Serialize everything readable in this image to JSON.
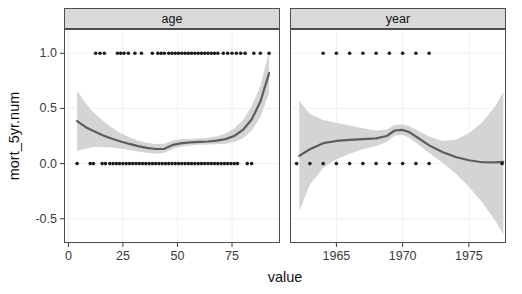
{
  "chart_data": {
    "type": "line",
    "title": "",
    "subtitle": "",
    "xlabel": "value",
    "ylabel": "mort_5yr.num",
    "grid": true,
    "legend": false,
    "facet_variable": "variable",
    "panels": [
      {
        "strip_label": "age",
        "xlim": [
          -2,
          97
        ],
        "ylim": [
          -0.72,
          1.22
        ],
        "xticks": [
          0,
          25,
          50,
          75
        ],
        "xtick_labels": [
          "0",
          "25",
          "50",
          "75"
        ],
        "yticks": [
          -0.5,
          0.0,
          0.5,
          1.0
        ],
        "ytick_labels": [
          "-0.5",
          "0.0",
          "0.5",
          "1.0"
        ],
        "fit": {
          "name": "loess fit",
          "x": [
            4,
            8,
            12,
            16,
            20,
            24,
            28,
            32,
            36,
            40,
            44,
            48,
            52,
            56,
            60,
            64,
            68,
            72,
            76,
            80,
            84,
            88,
            92
          ],
          "y": [
            0.385,
            0.33,
            0.29,
            0.255,
            0.225,
            0.2,
            0.178,
            0.158,
            0.142,
            0.132,
            0.134,
            0.17,
            0.186,
            0.192,
            0.196,
            0.2,
            0.208,
            0.222,
            0.25,
            0.305,
            0.4,
            0.56,
            0.82
          ]
        },
        "confidence_band": {
          "name": "95% confidence interval",
          "x": [
            4,
            8,
            12,
            16,
            20,
            24,
            28,
            32,
            36,
            40,
            44,
            48,
            52,
            56,
            60,
            64,
            68,
            72,
            76,
            80,
            84,
            88,
            92
          ],
          "lower": [
            0.115,
            0.135,
            0.15,
            0.15,
            0.145,
            0.135,
            0.122,
            0.11,
            0.098,
            0.09,
            0.095,
            0.135,
            0.155,
            0.165,
            0.17,
            0.172,
            0.175,
            0.18,
            0.195,
            0.23,
            0.3,
            0.42,
            0.64
          ],
          "upper": [
            0.66,
            0.545,
            0.455,
            0.385,
            0.325,
            0.275,
            0.238,
            0.208,
            0.188,
            0.178,
            0.18,
            0.21,
            0.222,
            0.225,
            0.228,
            0.234,
            0.248,
            0.272,
            0.318,
            0.395,
            0.52,
            0.7,
            1.02
          ]
        },
        "points_top": {
          "name": "observations mort_5yr.num = 1",
          "y": 1.0,
          "x": [
            12.5,
            14.5,
            16.5,
            22.5,
            24.0,
            25.5,
            27.5,
            30.5,
            33.5,
            38.5,
            41.0,
            42.5,
            44.0,
            46.0,
            47.5,
            49.0,
            50.5,
            52.0,
            53.5,
            55.0,
            56.5,
            58.0,
            59.5,
            61.0,
            62.5,
            64.0,
            65.5,
            67.0,
            68.5,
            71.0,
            73.0,
            75.0,
            77.0,
            79.0,
            81.0,
            85.0,
            88.0,
            92.0
          ]
        },
        "points_bottom": {
          "name": "observations mort_5yr.num = 0",
          "y": 0.0,
          "x": [
            4.0,
            10.0,
            11.5,
            15.5,
            17.0,
            19.0,
            20.5,
            22.0,
            23.5,
            25.0,
            26.5,
            28.0,
            29.5,
            31.0,
            32.5,
            34.0,
            35.5,
            37.0,
            38.5,
            40.0,
            41.5,
            43.0,
            44.5,
            46.0,
            47.5,
            49.0,
            50.5,
            52.0,
            53.5,
            55.0,
            56.5,
            58.0,
            59.5,
            61.0,
            62.5,
            64.0,
            65.5,
            67.0,
            68.5,
            70.0,
            71.5,
            73.0,
            74.5,
            76.0,
            77.5,
            82.0,
            84.0
          ]
        }
      },
      {
        "strip_label": "year",
        "xlim": [
          1961.5,
          1977.8
        ],
        "ylim": [
          -0.72,
          1.22
        ],
        "xticks": [
          1965,
          1970,
          1975
        ],
        "xtick_labels": [
          "1965",
          "1970",
          "1975"
        ],
        "yticks": [
          -0.5,
          0.0,
          0.5,
          1.0
        ],
        "ytick_labels": [
          "-0.5",
          "0.0",
          "0.5",
          "1.0"
        ],
        "fit": {
          "name": "loess fit",
          "x": [
            1962.2,
            1963.0,
            1964.0,
            1965.0,
            1966.0,
            1967.0,
            1968.0,
            1968.8,
            1969.4,
            1970.0,
            1970.5,
            1971.2,
            1972.0,
            1973.0,
            1974.0,
            1975.0,
            1976.0,
            1977.0,
            1977.6
          ],
          "y": [
            0.07,
            0.13,
            0.185,
            0.205,
            0.215,
            0.222,
            0.228,
            0.25,
            0.3,
            0.305,
            0.285,
            0.23,
            0.165,
            0.105,
            0.06,
            0.03,
            0.012,
            0.01,
            0.015
          ]
        },
        "confidence_band": {
          "name": "95% confidence interval",
          "x": [
            1962.2,
            1963.0,
            1964.0,
            1965.0,
            1966.0,
            1967.0,
            1968.0,
            1968.8,
            1969.4,
            1970.0,
            1970.5,
            1971.2,
            1972.0,
            1973.0,
            1974.0,
            1975.0,
            1976.0,
            1977.0,
            1977.6
          ],
          "lower": [
            -0.43,
            -0.19,
            -0.04,
            0.04,
            0.09,
            0.13,
            0.16,
            0.195,
            0.255,
            0.258,
            0.235,
            0.17,
            0.095,
            0.01,
            -0.09,
            -0.21,
            -0.35,
            -0.52,
            -0.64
          ],
          "upper": [
            0.57,
            0.45,
            0.395,
            0.37,
            0.345,
            0.32,
            0.3,
            0.31,
            0.35,
            0.355,
            0.34,
            0.295,
            0.245,
            0.205,
            0.215,
            0.275,
            0.375,
            0.52,
            0.65
          ]
        },
        "points_top": {
          "name": "observations mort_5yr.num = 1",
          "y": 1.0,
          "x": [
            1964.0,
            1965.0,
            1966.0,
            1967.0,
            1968.0,
            1969.0,
            1970.0,
            1971.0,
            1972.0
          ]
        },
        "points_bottom": {
          "name": "observations mort_5yr.num = 0",
          "y": 0.0,
          "x": [
            1962.0,
            1963.0,
            1964.0,
            1965.0,
            1966.0,
            1967.0,
            1968.0,
            1969.0,
            1970.0,
            1971.0,
            1972.0,
            1977.5
          ]
        }
      }
    ],
    "colors": {
      "line": "#5c5c5c",
      "band": "#d4d4d4",
      "point": "#1a1a1a",
      "panel_background": "#ffffff",
      "panel_border": "#4d4d4d",
      "strip_background": "#d9d9d9",
      "grid": "#f0f0f0",
      "axis_text": "#3a3a3a",
      "axis_title": "#111111"
    }
  }
}
